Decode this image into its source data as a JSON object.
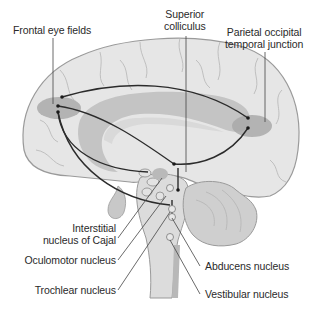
{
  "diagram": {
    "type": "anatomical-sagittal-brain",
    "colors": {
      "brain_fill": "#e6e6e6",
      "brain_outline": "#9a9a9a",
      "ventricle_fill": "#c4c4c4",
      "region_highlight": "#a9a9a9",
      "cerebellum_fill": "#cfcfcf",
      "pathway_line": "#2b2b2b",
      "leader_line": "#444444",
      "text": "#2a2a2a"
    },
    "labels": {
      "frontal_eye_fields": "Frontal eye fields",
      "superior_colliculus_line1": "Superior",
      "superior_colliculus_line2": "colliculus",
      "poti_line1": "Parietal occipital",
      "poti_line2": "temporal junction",
      "cajal_line1": "Interstitial",
      "cajal_line2": "nucleus of Cajal",
      "oculomotor": "Oculomotor nucleus",
      "trochlear": "Trochlear nucleus",
      "abducens": "Abducens nucleus",
      "vestibular": "Vestibular nucleus"
    }
  }
}
